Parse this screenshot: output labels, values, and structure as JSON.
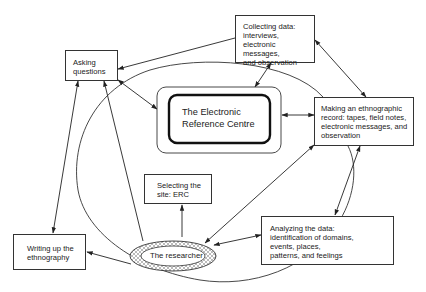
{
  "diagram": {
    "nodes": {
      "asking": {
        "label": "Asking\nquestions"
      },
      "collecting": {
        "label": "Collecting data:\ninterviews,\nelectronic messages,\nand observation"
      },
      "erc": {
        "label": "The Electronic\nReference Centre"
      },
      "record": {
        "label": "Making an ethnographic\nrecord:  tapes, field notes,\nelectronic messages, and\nobservation"
      },
      "selecting": {
        "label": "Selecting the\nsite: ERC"
      },
      "writing": {
        "label": "Writing up the\nethnography"
      },
      "researcher": {
        "label": "The researcher"
      },
      "analyzing": {
        "label": "Analyzing the data:\nidentification of domains,\nevents, places,\npatterns, and feelings"
      }
    },
    "edges": [
      {
        "from": "collecting",
        "to": "asking",
        "type": "one-way"
      },
      {
        "from": "asking",
        "to": "erc",
        "type": "two-way"
      },
      {
        "from": "collecting",
        "to": "erc",
        "type": "two-way"
      },
      {
        "from": "collecting",
        "to": "record",
        "type": "two-way"
      },
      {
        "from": "erc",
        "to": "record",
        "type": "two-way"
      },
      {
        "from": "record",
        "to": "analyzing",
        "type": "two-way"
      },
      {
        "from": "record",
        "to": "researcher",
        "type": "two-way"
      },
      {
        "from": "analyzing",
        "to": "researcher",
        "type": "two-way"
      },
      {
        "from": "researcher",
        "to": "selecting",
        "type": "one-way"
      },
      {
        "from": "researcher",
        "to": "writing",
        "type": "one-way"
      },
      {
        "from": "researcher",
        "to": "asking",
        "type": "one-way"
      },
      {
        "from": "writing",
        "to": "asking",
        "type": "two-way"
      }
    ],
    "colors": {
      "line": "#333333",
      "background": "#ffffff",
      "hatch": "#555555"
    }
  }
}
